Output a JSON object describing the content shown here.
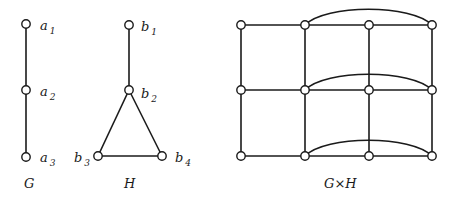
{
  "graphs": {
    "G": {
      "caption": "G",
      "nodes": [
        {
          "id": "a1",
          "base": "a",
          "sub": "1"
        },
        {
          "id": "a2",
          "base": "a",
          "sub": "2"
        },
        {
          "id": "a3",
          "base": "a",
          "sub": "3"
        }
      ],
      "edges": [
        [
          "a1",
          "a2"
        ],
        [
          "a2",
          "a3"
        ]
      ]
    },
    "H": {
      "caption": "H",
      "nodes": [
        {
          "id": "b1",
          "base": "b",
          "sub": "1"
        },
        {
          "id": "b2",
          "base": "b",
          "sub": "2"
        },
        {
          "id": "b3",
          "base": "b",
          "sub": "3"
        },
        {
          "id": "b4",
          "base": "b",
          "sub": "4"
        }
      ],
      "edges": [
        [
          "b1",
          "b2"
        ],
        [
          "b2",
          "b3"
        ],
        [
          "b2",
          "b4"
        ],
        [
          "b3",
          "b4"
        ]
      ]
    },
    "GxH": {
      "caption": "G×H",
      "rows": 3,
      "cols": 4,
      "arcs": "row-wise arc from column 2 to column 4 in each row"
    }
  }
}
